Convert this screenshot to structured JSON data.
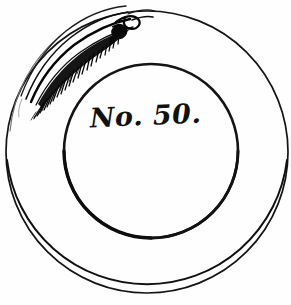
{
  "figure": {
    "kind": "engraving-illustration",
    "background_color": "#fefefe",
    "ink_color": "#111111",
    "width": 291,
    "height": 305
  },
  "label": {
    "text": "No. 50.",
    "style": "italic-script",
    "position": "center"
  },
  "outer_rim": {
    "name": "outer-rim-circle",
    "center_x": 147,
    "center_y": 152,
    "radius": 141,
    "stroke_width": 1.8
  },
  "inner_well": {
    "name": "inner-well-circle",
    "center_x": 151,
    "center_y": 151,
    "radius": 87,
    "stroke_width": 3.2
  },
  "ornament": {
    "name": "feather-fern-ornament",
    "location": "upper-left rim",
    "description": "engraved feather / fern frond with fine serrated barbs and a curled hooked tip",
    "arc_start_deg": 188,
    "arc_end_deg": 278,
    "barb_count": 26,
    "color": "#0b0b0b"
  },
  "accessibility": {
    "alt": "Black and white engraving of a round plate. Two concentric circles form the rim and the well. A feathery fern ornament decorates the upper left of the rim. The centre is inscribed No. 50."
  }
}
